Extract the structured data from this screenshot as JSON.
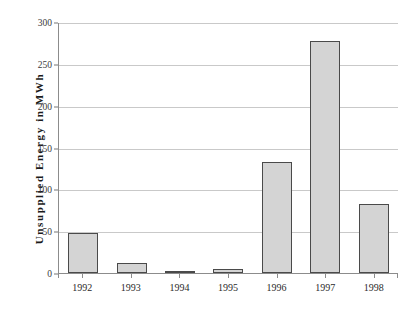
{
  "chart_data": {
    "type": "bar",
    "title": "",
    "xlabel": "",
    "ylabel": "Unsupplied Energy in MWh",
    "categories": [
      "1992",
      "1993",
      "1994",
      "1995",
      "1996",
      "1997",
      "1998"
    ],
    "values": [
      48,
      12,
      1,
      5,
      133,
      277,
      83
    ],
    "ylim": [
      0,
      300
    ],
    "yticks": [
      0,
      50,
      100,
      150,
      200,
      250,
      300
    ],
    "ytick_labels": [
      "0",
      "50",
      "100",
      "150",
      "200",
      "250",
      "300"
    ],
    "grid": true,
    "legend": null,
    "series": [
      {
        "name": "Unsupplied Energy",
        "values": [
          48,
          12,
          1,
          5,
          133,
          277,
          83
        ]
      }
    ],
    "colors": {
      "bar_fill": "#d4d4d4",
      "bar_border": "#4a4a4a",
      "gridline": "#c9c9c9",
      "axis": "#8c8c8c",
      "text": "#2a2a2a",
      "background": "#ffffff"
    }
  }
}
